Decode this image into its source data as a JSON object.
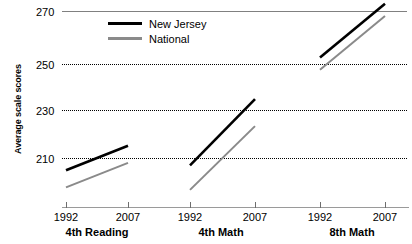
{
  "chart_data": {
    "type": "line",
    "title": "",
    "xlabel": "",
    "ylabel": "Average scale scores",
    "ylim": [
      195,
      277
    ],
    "yticks": [
      210,
      230,
      250,
      270
    ],
    "ytick_labels": [
      "210",
      "230",
      "250",
      "270"
    ],
    "grid": true,
    "legend_position": "top-left",
    "x": [
      "1992",
      "2007"
    ],
    "groups": [
      {
        "label": "4th Reading",
        "xtick_labels": [
          "1992",
          "2007"
        ],
        "series": [
          {
            "name": "New Jersey",
            "values": [
              205,
              215
            ]
          },
          {
            "name": "National",
            "values": [
              198,
              208
            ]
          }
        ]
      },
      {
        "label": "4th Math",
        "xtick_labels": [
          "1992",
          "2007"
        ],
        "series": [
          {
            "name": "New Jersey",
            "values": [
              207,
              234
            ]
          },
          {
            "name": "National",
            "values": [
              197,
              223
            ]
          }
        ]
      },
      {
        "label": "8th Math",
        "xtick_labels": [
          "1992",
          "2007"
        ],
        "series": [
          {
            "name": "New Jersey",
            "values": [
              251,
              273
            ]
          },
          {
            "name": "National",
            "values": [
              246,
              268
            ]
          }
        ]
      }
    ],
    "series_colors": {
      "New Jersey": "#000000",
      "National": "#8a8a8a"
    }
  },
  "axis": {
    "y_title": "Average scale scores",
    "y_labels": [
      "270",
      "250",
      "230",
      "210"
    ]
  },
  "legend": {
    "items": [
      {
        "label": "New Jersey",
        "color": "#000000"
      },
      {
        "label": "National",
        "color": "#8a8a8a"
      }
    ]
  },
  "xaxis": {
    "ticks": [
      "1992",
      "2007",
      "1992",
      "2007",
      "1992",
      "2007"
    ],
    "group_labels": [
      "4th Reading",
      "4th Math",
      "8th Math"
    ]
  }
}
